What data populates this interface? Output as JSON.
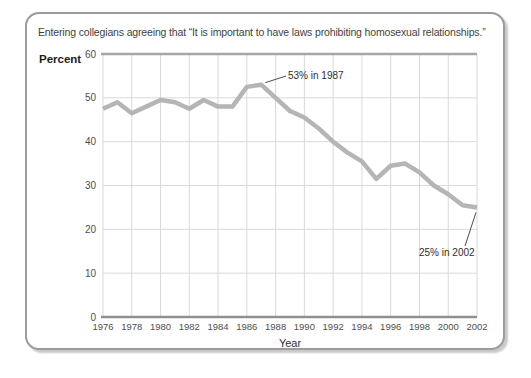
{
  "chart_data": {
    "type": "line",
    "title": "Entering collegians agreeing that “It is important to have laws prohibiting homosexual relationships.”",
    "xlabel": "Year",
    "ylabel": "Percent",
    "ylim": [
      0,
      60
    ],
    "yticks": [
      0,
      10,
      20,
      30,
      40,
      50,
      60
    ],
    "xticks": [
      1976,
      1978,
      1980,
      1982,
      1984,
      1986,
      1988,
      1990,
      1992,
      1994,
      1996,
      1998,
      2000,
      2002
    ],
    "x": [
      1976,
      1977,
      1978,
      1979,
      1980,
      1981,
      1982,
      1983,
      1984,
      1985,
      1986,
      1987,
      1988,
      1989,
      1990,
      1991,
      1992,
      1993,
      1994,
      1995,
      1996,
      1997,
      1998,
      1999,
      2000,
      2001,
      2002
    ],
    "series": [
      {
        "name": "Percent agreeing",
        "values": [
          47.5,
          49,
          46.5,
          48,
          49.5,
          49,
          47.5,
          49.5,
          48,
          48,
          52.5,
          53,
          50,
          47,
          45.5,
          43,
          40,
          37.5,
          35.5,
          31.5,
          34.5,
          35,
          33,
          30,
          28,
          25.5,
          25
        ]
      }
    ],
    "annotations": [
      {
        "text": "53% in 1987",
        "year": 1987,
        "value": 53
      },
      {
        "text": "25% in 2002",
        "year": 2002,
        "value": 25
      }
    ],
    "grid": true,
    "legend": false,
    "line_color": "#b5b5b5",
    "grid_color": "#d9d9d9",
    "top_rule_color": "#a6a6a6",
    "axis_color": "#8f8f8f",
    "leader_color": "#4a4a4a"
  }
}
